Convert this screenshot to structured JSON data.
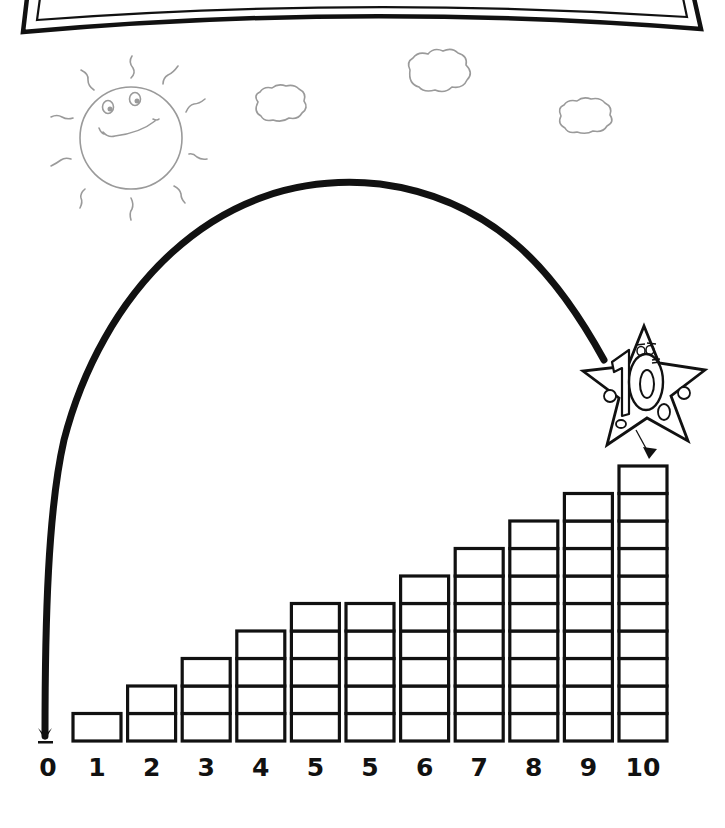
{
  "worksheet": {
    "title_banner": {
      "text": ""
    },
    "scene": {
      "sun": {
        "face": "smiling",
        "rays": 10
      },
      "clouds": 3,
      "arc": {
        "from_label": "10",
        "to_label": "0",
        "direction": "backward"
      },
      "mascot": {
        "text": "10",
        "shape": "star"
      }
    },
    "colors": {
      "ink": "#111111",
      "sketch": "#9a9a9a",
      "paper": "#ffffff"
    }
  },
  "chart_data": {
    "type": "bar",
    "title": "",
    "xlabel": "",
    "ylabel": "",
    "categories": [
      "0",
      "1",
      "2",
      "3",
      "4",
      "5",
      "5",
      "6",
      "7",
      "8",
      "9",
      "10"
    ],
    "values": [
      0,
      1,
      2,
      3,
      4,
      5,
      5,
      6,
      7,
      8,
      9,
      10
    ],
    "unit": "stacked blocks",
    "ylim": [
      0,
      10
    ],
    "grid": false,
    "legend": "none",
    "annotations": [
      "arrow arc from column 10 back to 0",
      "star mascot labeled 10 above column 10"
    ]
  },
  "labels": [
    "0",
    "1",
    "2",
    "3",
    "4",
    "5",
    "5",
    "6",
    "7",
    "8",
    "9",
    "10"
  ]
}
